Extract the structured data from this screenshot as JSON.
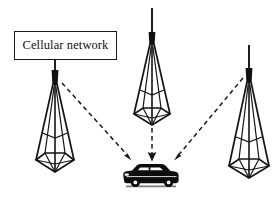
{
  "figure": {
    "background_color": "#ffffff",
    "stroke_color": "#1a1a1a",
    "width": 275,
    "height": 199
  },
  "label": {
    "text": "Cellular network",
    "box": {
      "x": 14,
      "y": 31,
      "width": 103,
      "height": 29
    },
    "border_color": "#1a1a1a",
    "text_color": "#111111"
  },
  "towers": [
    {
      "id": "tower-left",
      "name": "left-cell-tower",
      "mast_top_x": 55,
      "mast_top_y": 36,
      "body_top_x": 55,
      "body_top_y": 84,
      "base_y": 172,
      "base_half_width": 20,
      "connected_to_label": true
    },
    {
      "id": "tower-center",
      "name": "center-cell-tower",
      "mast_top_x": 152,
      "mast_top_y": 8,
      "body_top_x": 152,
      "body_top_y": 44,
      "base_y": 125,
      "base_half_width": 20,
      "connected_to_label": false
    },
    {
      "id": "tower-right",
      "name": "right-cell-tower",
      "mast_top_x": 249,
      "mast_top_y": 45,
      "body_top_x": 249,
      "body_top_y": 82,
      "base_y": 178,
      "base_half_width": 21,
      "connected_to_label": false
    }
  ],
  "signals": [
    {
      "id": "signal-left",
      "name": "signal-link-left",
      "from_tower": "tower-left",
      "start": {
        "x": 62,
        "y": 83
      },
      "end": {
        "x": 131,
        "y": 160
      },
      "style": "dashed",
      "arrow": true
    },
    {
      "id": "signal-center",
      "name": "signal-link-center",
      "from_tower": "tower-center",
      "start": {
        "x": 152,
        "y": 128
      },
      "end": {
        "x": 152,
        "y": 160
      },
      "style": "dashed",
      "arrow": true
    },
    {
      "id": "signal-right",
      "name": "signal-link-right",
      "from_tower": "tower-right",
      "start": {
        "x": 243,
        "y": 78
      },
      "end": {
        "x": 175,
        "y": 160
      },
      "style": "dashed",
      "arrow": true
    }
  ],
  "vehicle": {
    "name": "car",
    "kind": "suv",
    "color": "#0d0d0d",
    "center_x": 150,
    "center_y": 178,
    "facing": "left"
  }
}
